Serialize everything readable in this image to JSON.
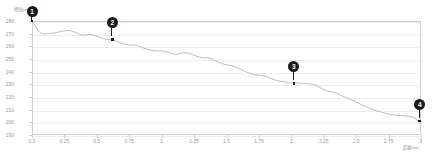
{
  "chart_data": {
    "type": "line",
    "title": "",
    "xlabel": "距離(km)",
    "ylabel": "標高(m)",
    "xlim": [
      0,
      3
    ],
    "ylim": [
      190,
      280
    ],
    "grid": true,
    "legend": "none",
    "line_color": "#b4b4b4",
    "marker_color": "#1b1b1b",
    "axis_color": "#cfcfcf",
    "tick_color": "#9a9a9a",
    "xticks": [
      "0.0",
      "0.25",
      "0.5",
      "0.75",
      "1",
      "1.25",
      "1.5",
      "1.75",
      "2",
      "2.25",
      "2.5",
      "2.75",
      "3"
    ],
    "xtick_values": [
      0,
      0.25,
      0.5,
      0.75,
      1,
      1.25,
      1.5,
      1.75,
      2,
      2.25,
      2.5,
      2.75,
      3
    ],
    "yticks": [
      "280",
      "270",
      "260",
      "250",
      "240",
      "230",
      "220",
      "210",
      "200",
      "190"
    ],
    "ytick_values": [
      280,
      270,
      260,
      250,
      240,
      230,
      220,
      210,
      200,
      190
    ],
    "series": [
      {
        "name": "elevation",
        "x": [
          0.0,
          0.02,
          0.04,
          0.06,
          0.09,
          0.12,
          0.15,
          0.18,
          0.21,
          0.24,
          0.27,
          0.3,
          0.33,
          0.36,
          0.39,
          0.42,
          0.45,
          0.48,
          0.51,
          0.54,
          0.57,
          0.6,
          0.63,
          0.66,
          0.69,
          0.72,
          0.75,
          0.78,
          0.81,
          0.84,
          0.87,
          0.9,
          0.93,
          0.96,
          0.99,
          1.02,
          1.05,
          1.08,
          1.11,
          1.14,
          1.17,
          1.2,
          1.23,
          1.26,
          1.29,
          1.32,
          1.35,
          1.38,
          1.41,
          1.44,
          1.47,
          1.5,
          1.53,
          1.56,
          1.59,
          1.62,
          1.65,
          1.68,
          1.71,
          1.74,
          1.77,
          1.8,
          1.83,
          1.86,
          1.89,
          1.92,
          1.95,
          1.98,
          2.01,
          2.04,
          2.07,
          2.1,
          2.13,
          2.16,
          2.19,
          2.22,
          2.25,
          2.28,
          2.31,
          2.34,
          2.37,
          2.4,
          2.43,
          2.46,
          2.49,
          2.52,
          2.55,
          2.58,
          2.61,
          2.64,
          2.67,
          2.7,
          2.73,
          2.76,
          2.79,
          2.82,
          2.85,
          2.88,
          2.91,
          2.94,
          2.97,
          3.0
        ],
        "y": [
          280.0,
          276.5,
          273.0,
          271.2,
          270.4,
          270.6,
          271.0,
          271.5,
          272.2,
          272.8,
          273.2,
          272.6,
          271.6,
          270.4,
          269.3,
          269.8,
          270.0,
          269.2,
          268.0,
          266.8,
          266.0,
          265.6,
          265.2,
          264.0,
          262.8,
          262.0,
          261.4,
          261.6,
          261.0,
          259.8,
          258.6,
          257.6,
          257.0,
          256.6,
          256.8,
          256.4,
          255.6,
          254.6,
          254.0,
          254.6,
          255.4,
          255.0,
          254.0,
          252.8,
          251.8,
          251.2,
          251.4,
          250.4,
          249.0,
          247.6,
          246.4,
          245.6,
          245.0,
          244.2,
          243.0,
          241.4,
          240.0,
          238.8,
          238.0,
          237.4,
          237.2,
          236.4,
          235.2,
          234.0,
          233.0,
          232.4,
          232.0,
          231.4,
          231.0,
          231.2,
          231.0,
          230.6,
          230.4,
          230.2,
          229.4,
          227.6,
          225.8,
          224.6,
          224.0,
          223.4,
          222.0,
          220.4,
          219.0,
          217.8,
          216.6,
          215.0,
          213.4,
          212.0,
          210.6,
          209.4,
          208.4,
          207.6,
          206.8,
          206.0,
          205.4,
          205.0,
          204.8,
          204.6,
          204.4,
          203.8,
          202.0,
          198.4
        ]
      }
    ],
    "waypoints": [
      {
        "label": "1",
        "x": 0.0,
        "y": 280.0,
        "style": "flat"
      },
      {
        "label": "2",
        "x": 0.62,
        "y": 265.4,
        "style": "pin"
      },
      {
        "label": "3",
        "x": 2.02,
        "y": 230.8,
        "style": "pin"
      },
      {
        "label": "4",
        "x": 2.99,
        "y": 201.0,
        "style": "pin"
      }
    ]
  }
}
